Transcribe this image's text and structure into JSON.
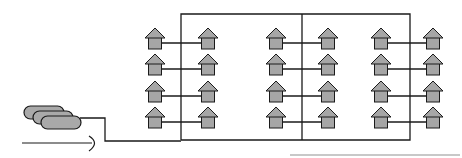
{
  "diagram": {
    "colors": {
      "line": "#1a1a1a",
      "house_fill": "#a6a6a6",
      "tank_fill": "#a9a9a9",
      "underline": "#c8c8c8"
    },
    "tanks": {
      "count": 3
    },
    "columns_x": [
      155,
      208,
      276,
      328,
      381,
      433
    ],
    "rows_y": [
      40,
      66,
      93,
      119
    ],
    "pairs": [
      {
        "left_col": 0,
        "right_col": 1
      },
      {
        "left_col": 2,
        "right_col": 3
      },
      {
        "left_col": 4,
        "right_col": 5
      }
    ],
    "house_count": 24
  }
}
